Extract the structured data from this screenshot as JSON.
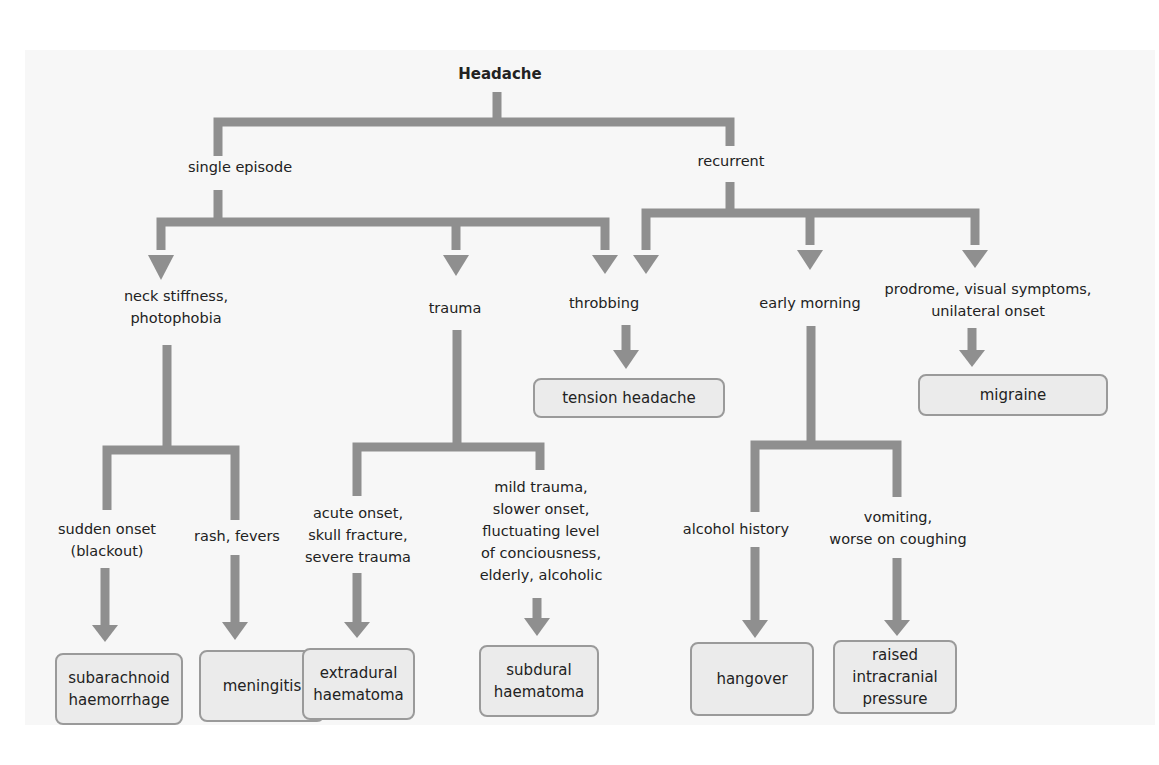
{
  "colors": {
    "connector": "#8f8f8f",
    "box_fill": "#ebebeb",
    "box_border": "#9a9a9a",
    "panel": "#f7f7f7"
  },
  "root": "Headache",
  "branches": {
    "single_episode": "single episode",
    "recurrent": "recurrent"
  },
  "criteria": {
    "neck_stiffness": "neck stiffness,\nphotophobia",
    "trauma": "trauma",
    "throbbing": "throbbing",
    "early_morning": "early morning",
    "prodrome": "prodrome, visual symptoms,\nunilateral onset",
    "sudden_onset": "sudden onset\n(blackout)",
    "rash": "rash, fevers",
    "acute_onset": "acute onset,\nskull fracture,\nsevere trauma",
    "mild_trauma": "mild trauma,\nslower onset,\nfluctuating level\nof conciousness,\nelderly, alcoholic",
    "alcohol": "alcohol history",
    "vomiting": "vomiting,\nworse on coughing"
  },
  "diagnoses": {
    "tension": "tension headache",
    "migraine": "migraine",
    "sah": "subarachnoid\nhaemorrhage",
    "meningitis": "meningitis",
    "extradural": "extradural\nhaematoma",
    "subdural": "subdural\nhaematoma",
    "hangover": "hangover",
    "raised_icp": "raised\nintracranial\npressure"
  }
}
